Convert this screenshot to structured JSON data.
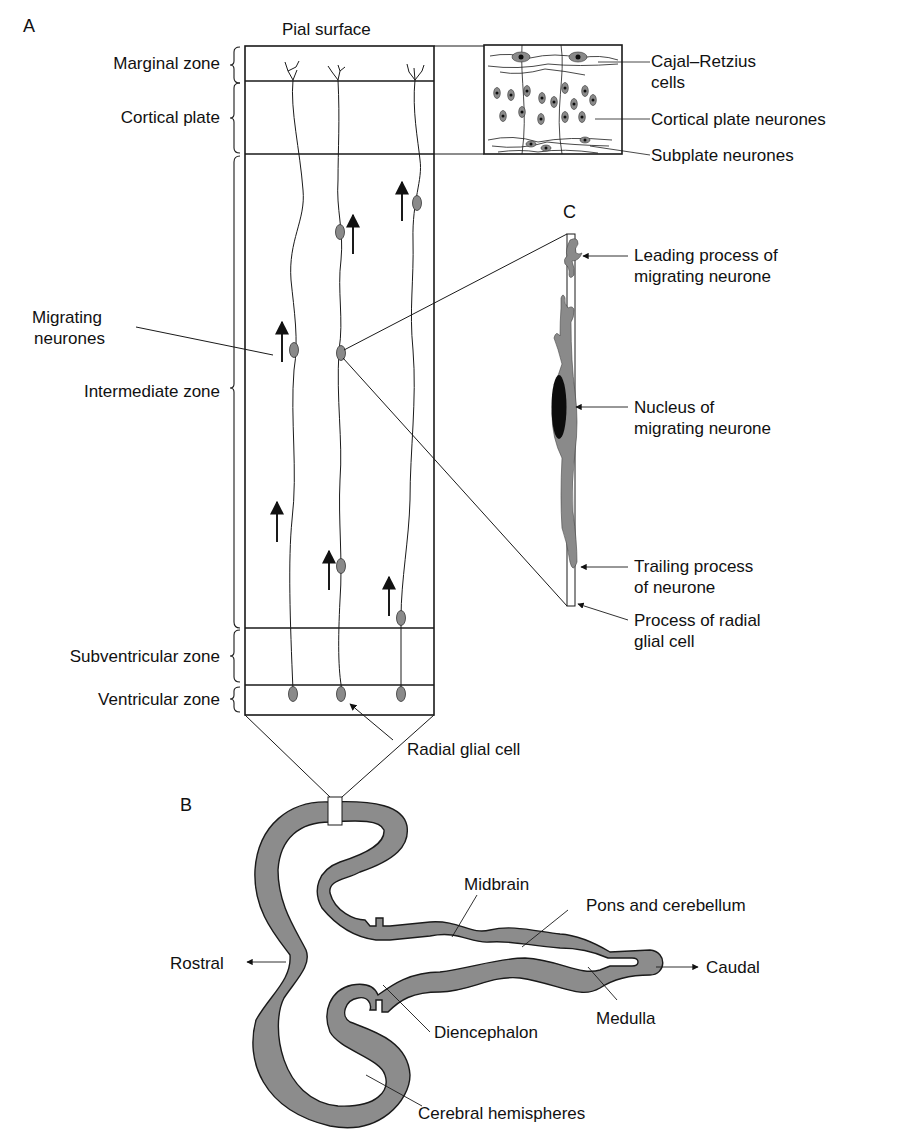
{
  "figure": {
    "panels": {
      "a": {
        "letter": "A",
        "top_label": "Pial surface",
        "zones": [
          {
            "id": "marginal",
            "label": "Marginal zone"
          },
          {
            "id": "cortical",
            "label": "Cortical plate"
          },
          {
            "id": "intermediate",
            "label": "Intermediate zone"
          },
          {
            "id": "subventricular",
            "label": "Subventricular zone"
          },
          {
            "id": "ventricular",
            "label": "Ventricular zone"
          }
        ],
        "migrating_neurones": [
          "Migrating",
          "neurones"
        ],
        "radial_glial_cell": "Radial glial cell",
        "inset": {
          "cajal_retzius": [
            "Cajal–Retzius",
            "cells"
          ],
          "cortical_plate_neurones": "Cortical plate neurones",
          "subplate_neurones": "Subplate neurones"
        }
      },
      "b": {
        "letter": "B",
        "rostral": "Rostral",
        "caudal": "Caudal",
        "regions": {
          "midbrain": "Midbrain",
          "pons_cerebellum": "Pons and cerebellum",
          "medulla": "Medulla",
          "diencephalon": "Diencephalon",
          "cerebral_hemispheres": "Cerebral hemispheres"
        }
      },
      "c": {
        "letter": "C",
        "leading_process": [
          "Leading process of",
          "migrating neurone"
        ],
        "nucleus": [
          "Nucleus of",
          "migrating neurone"
        ],
        "trailing_process": [
          "Trailing process",
          "of neurone"
        ],
        "radial_glial_process": [
          "Process of radial",
          "glial cell"
        ]
      }
    },
    "colors": {
      "line": "#1a1a1a",
      "cell_fill": "#8a8a8a",
      "tissue_fill": "#8c8c8c",
      "nucleus_fill": "#0d0d0d"
    }
  }
}
